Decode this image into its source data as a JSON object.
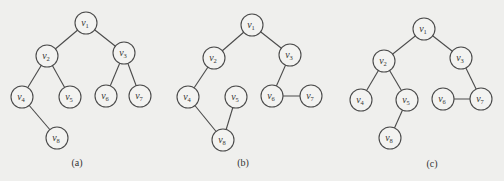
{
  "figure": {
    "graphs": [
      {
        "id": "a",
        "caption": "(a)",
        "nodes": [
          {
            "id": "v1",
            "label": "v",
            "sub": "1"
          },
          {
            "id": "v2",
            "label": "v",
            "sub": "2"
          },
          {
            "id": "v3",
            "label": "v",
            "sub": "3"
          },
          {
            "id": "v4",
            "label": "v",
            "sub": "4"
          },
          {
            "id": "v5",
            "label": "v",
            "sub": "5"
          },
          {
            "id": "v6",
            "label": "v",
            "sub": "6"
          },
          {
            "id": "v7",
            "label": "v",
            "sub": "7"
          },
          {
            "id": "v8",
            "label": "v",
            "sub": "8"
          }
        ],
        "edges": [
          [
            "v1",
            "v2"
          ],
          [
            "v1",
            "v3"
          ],
          [
            "v2",
            "v4"
          ],
          [
            "v2",
            "v5"
          ],
          [
            "v3",
            "v6"
          ],
          [
            "v3",
            "v7"
          ],
          [
            "v4",
            "v8"
          ]
        ]
      },
      {
        "id": "b",
        "caption": "(b)",
        "nodes": [
          {
            "id": "v1",
            "label": "v",
            "sub": "1"
          },
          {
            "id": "v2",
            "label": "v",
            "sub": "2"
          },
          {
            "id": "v3",
            "label": "v",
            "sub": "3"
          },
          {
            "id": "v4",
            "label": "v",
            "sub": "4"
          },
          {
            "id": "v5",
            "label": "v",
            "sub": "5"
          },
          {
            "id": "v6",
            "label": "v",
            "sub": "6"
          },
          {
            "id": "v7",
            "label": "v",
            "sub": "7"
          },
          {
            "id": "v8",
            "label": "v",
            "sub": "8"
          }
        ],
        "edges": [
          [
            "v1",
            "v2"
          ],
          [
            "v1",
            "v3"
          ],
          [
            "v2",
            "v4"
          ],
          [
            "v4",
            "v8"
          ],
          [
            "v5",
            "v8"
          ],
          [
            "v3",
            "v6"
          ],
          [
            "v6",
            "v7"
          ]
        ]
      },
      {
        "id": "c",
        "caption": "(c)",
        "nodes": [
          {
            "id": "v1",
            "label": "v",
            "sub": "1"
          },
          {
            "id": "v2",
            "label": "v",
            "sub": "2"
          },
          {
            "id": "v3",
            "label": "v",
            "sub": "3"
          },
          {
            "id": "v4",
            "label": "v",
            "sub": "4"
          },
          {
            "id": "v5",
            "label": "v",
            "sub": "5"
          },
          {
            "id": "v6",
            "label": "v",
            "sub": "6"
          },
          {
            "id": "v7",
            "label": "v",
            "sub": "7"
          },
          {
            "id": "v8",
            "label": "v",
            "sub": "8"
          }
        ],
        "edges": [
          [
            "v1",
            "v2"
          ],
          [
            "v1",
            "v3"
          ],
          [
            "v2",
            "v4"
          ],
          [
            "v2",
            "v5"
          ],
          [
            "v5",
            "v8"
          ],
          [
            "v3",
            "v7"
          ],
          [
            "v6",
            "v7"
          ]
        ]
      }
    ]
  }
}
